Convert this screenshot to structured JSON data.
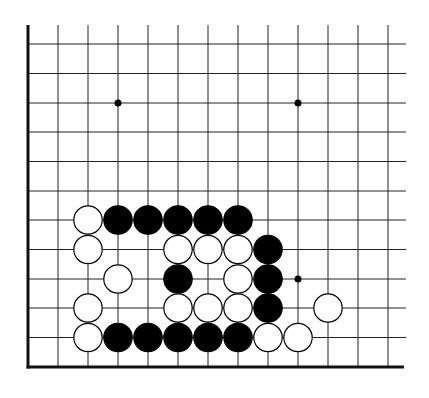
{
  "diagram": {
    "board_region": "lower-left corner",
    "columns": 13,
    "rows": 12,
    "colors": {
      "line": "#222222",
      "edge": "#111111",
      "black_stone": "#000000",
      "white_stone": "#ffffff",
      "background": "#ffffff"
    },
    "star_points": [
      {
        "col": 3,
        "row": 3
      },
      {
        "col": 9,
        "row": 3
      },
      {
        "col": 9,
        "row": 9
      }
    ],
    "stones": [
      {
        "color": "white",
        "col": 2,
        "row": 7
      },
      {
        "color": "black",
        "col": 3,
        "row": 7
      },
      {
        "color": "black",
        "col": 4,
        "row": 7
      },
      {
        "color": "black",
        "col": 5,
        "row": 7
      },
      {
        "color": "black",
        "col": 6,
        "row": 7
      },
      {
        "color": "black",
        "col": 7,
        "row": 7
      },
      {
        "color": "white",
        "col": 2,
        "row": 8
      },
      {
        "color": "white",
        "col": 5,
        "row": 8
      },
      {
        "color": "white",
        "col": 6,
        "row": 8
      },
      {
        "color": "white",
        "col": 7,
        "row": 8
      },
      {
        "color": "black",
        "col": 8,
        "row": 8
      },
      {
        "color": "white",
        "col": 3,
        "row": 9
      },
      {
        "color": "black",
        "col": 5,
        "row": 9
      },
      {
        "color": "white",
        "col": 7,
        "row": 9
      },
      {
        "color": "black",
        "col": 8,
        "row": 9
      },
      {
        "color": "white",
        "col": 2,
        "row": 10
      },
      {
        "color": "white",
        "col": 5,
        "row": 10
      },
      {
        "color": "white",
        "col": 6,
        "row": 10
      },
      {
        "color": "white",
        "col": 7,
        "row": 10
      },
      {
        "color": "black",
        "col": 8,
        "row": 10
      },
      {
        "color": "white",
        "col": 10,
        "row": 10
      },
      {
        "color": "white",
        "col": 2,
        "row": 11
      },
      {
        "color": "black",
        "col": 3,
        "row": 11
      },
      {
        "color": "black",
        "col": 4,
        "row": 11
      },
      {
        "color": "black",
        "col": 5,
        "row": 11
      },
      {
        "color": "black",
        "col": 6,
        "row": 11
      },
      {
        "color": "black",
        "col": 7,
        "row": 11
      },
      {
        "color": "white",
        "col": 8,
        "row": 11
      },
      {
        "color": "white",
        "col": 9,
        "row": 11
      }
    ]
  }
}
